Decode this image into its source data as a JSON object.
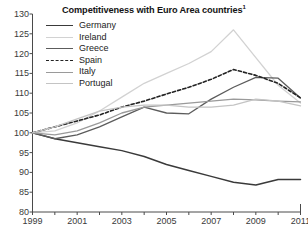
{
  "chart_data": {
    "type": "line",
    "title": "Competitiveness with Euro Area countries",
    "title_superscript": "1",
    "xlabel": "",
    "ylabel": "",
    "xlim": [
      1999,
      2011
    ],
    "ylim": [
      80,
      130
    ],
    "yticks": [
      80,
      85,
      90,
      95,
      100,
      105,
      110,
      115,
      120,
      125,
      130
    ],
    "xticks": [
      1999,
      2000,
      2001,
      2002,
      2003,
      2004,
      2005,
      2006,
      2007,
      2008,
      2009,
      2010,
      2011
    ],
    "xtick_labels": [
      "1999",
      "",
      "2001",
      "",
      "2003",
      "",
      "2005",
      "",
      "2007",
      "",
      "2009",
      "",
      "2011"
    ],
    "grid": false,
    "legend_position": "top-left",
    "x": [
      1999,
      2000,
      2001,
      2002,
      2003,
      2004,
      2005,
      2006,
      2007,
      2008,
      2009,
      2010,
      2011
    ],
    "series": [
      {
        "name": "Germany",
        "color": "#3a3a3a",
        "dash": "none",
        "width": 1.5,
        "values": [
          100,
          98.5,
          97.5,
          96.5,
          95.5,
          94,
          92,
          90.5,
          89,
          87.5,
          86.8,
          88.2,
          88.2
        ]
      },
      {
        "name": "Ireland",
        "color": "#d2d2d2",
        "dash": "none",
        "width": 1.3,
        "values": [
          100,
          100.5,
          102.5,
          105.5,
          109,
          112.5,
          115,
          117.5,
          120.5,
          126,
          119,
          112,
          107.5
        ]
      },
      {
        "name": "Greece",
        "color": "#5c5c5c",
        "dash": "none",
        "width": 1.3,
        "values": [
          100,
          98.5,
          99.5,
          101.5,
          104,
          106.5,
          105,
          104.8,
          108.5,
          111.5,
          114,
          113.8,
          108.8
        ]
      },
      {
        "name": "Spain",
        "color": "#232323",
        "dash": "dashed",
        "width": 1.6,
        "values": [
          100,
          101.5,
          103,
          104.5,
          106.5,
          108,
          109.8,
          111.5,
          113.5,
          116,
          114.5,
          112.5,
          108.8
        ]
      },
      {
        "name": "Italy",
        "color": "#9a9a9a",
        "dash": "none",
        "width": 1.3,
        "values": [
          100,
          99.5,
          100.5,
          102.5,
          105,
          106.5,
          107,
          107.5,
          108,
          108.5,
          108.3,
          108,
          107.8
        ]
      },
      {
        "name": "Portugal",
        "color": "#c4c4c4",
        "dash": "none",
        "width": 1.3,
        "values": [
          100,
          101.5,
          103.5,
          105.5,
          106.5,
          107,
          107,
          106.5,
          106.5,
          107,
          108.5,
          108,
          106.8
        ]
      }
    ]
  },
  "legend": {
    "items": [
      {
        "label": "Germany"
      },
      {
        "label": "Ireland"
      },
      {
        "label": "Greece"
      },
      {
        "label": "Spain"
      },
      {
        "label": "Italy"
      },
      {
        "label": "Portugal"
      }
    ]
  },
  "axis": {
    "line_color": "#4a4a4a",
    "tick_color": "#4a4a4a"
  }
}
